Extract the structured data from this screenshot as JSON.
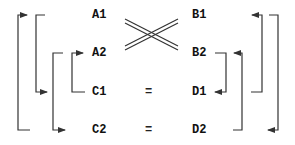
{
  "diagram": {
    "left_column": [
      "A1",
      "A2",
      "C1",
      "C2"
    ],
    "right_column": [
      "B1",
      "B2",
      "D1",
      "D2"
    ],
    "relations": {
      "row_c": "=",
      "row_d": "="
    },
    "cross_symbol": "double-line-cross between A1/A2 and B1/B2",
    "colors": {
      "line": "#333333",
      "text": "#111111",
      "background": "#ffffff"
    }
  }
}
